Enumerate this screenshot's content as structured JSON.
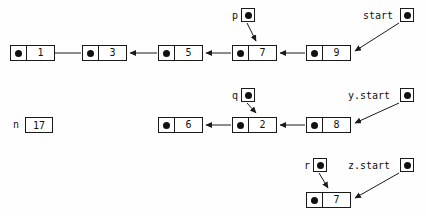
{
  "diagram": {
    "background_color": "#fefefe",
    "stroke_color": "#1a1a1a",
    "dot_color": "#111111"
  },
  "nodes": [
    {
      "id": "n1",
      "value": "1",
      "x": 10,
      "y": 45,
      "row": "top"
    },
    {
      "id": "n3",
      "value": "3",
      "x": 82,
      "y": 45,
      "row": "top"
    },
    {
      "id": "n5",
      "value": "5",
      "x": 158,
      "y": 45,
      "row": "top"
    },
    {
      "id": "n7",
      "value": "7",
      "x": 232,
      "y": 45,
      "row": "top"
    },
    {
      "id": "n9",
      "value": "9",
      "x": 306,
      "y": 45,
      "row": "top"
    },
    {
      "id": "n6",
      "value": "6",
      "x": 158,
      "y": 117,
      "row": "middle"
    },
    {
      "id": "n2",
      "value": "2",
      "x": 232,
      "y": 117,
      "row": "middle"
    },
    {
      "id": "n8",
      "value": "8",
      "x": 306,
      "y": 117,
      "row": "middle"
    },
    {
      "id": "n7b",
      "value": "7",
      "x": 306,
      "y": 192,
      "row": "bottom"
    }
  ],
  "pointers": [
    {
      "id": "p",
      "label": "p",
      "label_x": 232,
      "label_y": 10,
      "box_x": 241,
      "box_y": 8
    },
    {
      "id": "start",
      "label": "start",
      "label_x": 363,
      "label_y": 10,
      "box_x": 400,
      "box_y": 8
    },
    {
      "id": "q",
      "label": "q",
      "label_x": 232,
      "label_y": 90,
      "box_x": 241,
      "box_y": 88
    },
    {
      "id": "ystart",
      "label": "y.start",
      "label_x": 348,
      "label_y": 90,
      "box_x": 400,
      "box_y": 88
    },
    {
      "id": "r",
      "label": "r",
      "label_x": 304,
      "label_y": 160,
      "box_x": 313,
      "box_y": 158
    },
    {
      "id": "zstart",
      "label": "z.start",
      "label_x": 348,
      "label_y": 160,
      "box_x": 400,
      "box_y": 158
    }
  ],
  "variables": [
    {
      "id": "n",
      "label": "n",
      "value": "17",
      "label_x": 13,
      "label_y": 120,
      "box_x": 25,
      "box_y": 117
    }
  ],
  "links": [
    {
      "from": "n3",
      "to": "n1",
      "type": "list-next"
    },
    {
      "from": "n5",
      "to": "n3",
      "type": "list-next"
    },
    {
      "from": "n7",
      "to": "n5",
      "type": "list-next"
    },
    {
      "from": "n9",
      "to": "n7",
      "type": "list-next"
    },
    {
      "from": "start",
      "to": "n9",
      "type": "pointer"
    },
    {
      "from": "p",
      "to": "n7",
      "type": "pointer"
    },
    {
      "from": "n2",
      "to": "n6",
      "type": "list-next"
    },
    {
      "from": "n8",
      "to": "n2",
      "type": "list-next"
    },
    {
      "from": "ystart",
      "to": "n8",
      "type": "pointer"
    },
    {
      "from": "q",
      "to": "n2",
      "type": "pointer"
    },
    {
      "from": "r",
      "to": "n7b",
      "type": "pointer"
    },
    {
      "from": "zstart",
      "to": "n7b",
      "type": "pointer"
    }
  ],
  "arrow_paths": [
    {
      "name": "arrow-n3-to-n1",
      "x1": 81,
      "y1": 53,
      "x2": 47,
      "y2": 53
    },
    {
      "name": "arrow-n5-to-n3",
      "x1": 157,
      "y1": 53,
      "x2": 128,
      "y2": 53
    },
    {
      "name": "arrow-n7-to-n5",
      "x1": 231,
      "y1": 53,
      "x2": 204,
      "y2": 53
    },
    {
      "name": "arrow-n9-to-n7",
      "x1": 305,
      "y1": 53,
      "x2": 278,
      "y2": 53
    },
    {
      "name": "arrow-start-to-n9",
      "x1": 399,
      "y1": 22,
      "x2": 353,
      "y2": 52
    },
    {
      "name": "arrow-p-to-n7",
      "x1": 247,
      "y1": 23,
      "x2": 256,
      "y2": 42
    },
    {
      "name": "arrow-n2-to-n6",
      "x1": 231,
      "y1": 125,
      "x2": 204,
      "y2": 125
    },
    {
      "name": "arrow-n8-to-n2",
      "x1": 305,
      "y1": 125,
      "x2": 278,
      "y2": 125
    },
    {
      "name": "arrow-ystart-to-n8",
      "x1": 399,
      "y1": 102,
      "x2": 353,
      "y2": 124
    },
    {
      "name": "arrow-q-to-n2",
      "x1": 247,
      "y1": 103,
      "x2": 256,
      "y2": 114
    },
    {
      "name": "arrow-r-to-n7b",
      "x1": 319,
      "y1": 173,
      "x2": 328,
      "y2": 189
    },
    {
      "name": "arrow-zstart-to-n7b",
      "x1": 399,
      "y1": 172,
      "x2": 353,
      "y2": 199
    }
  ]
}
